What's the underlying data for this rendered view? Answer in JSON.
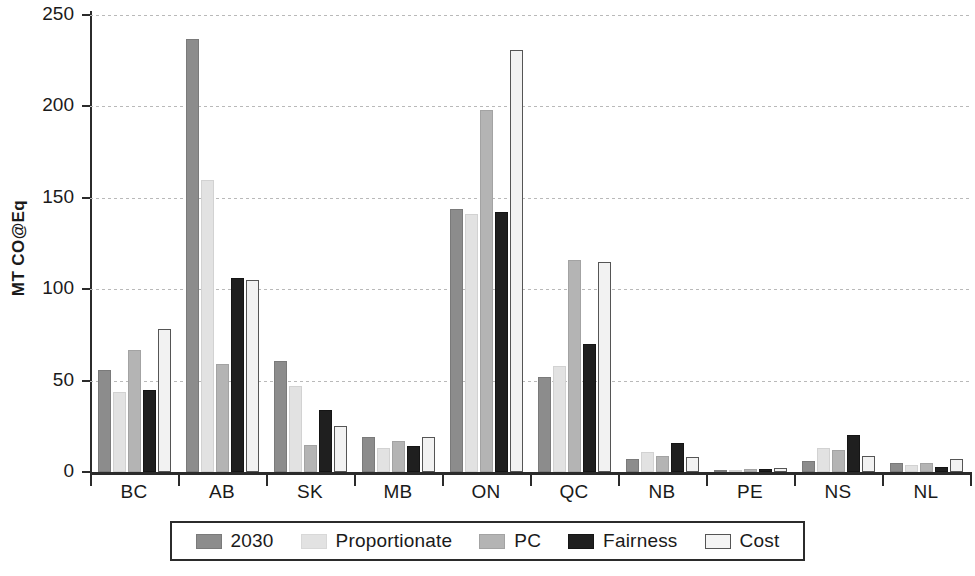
{
  "chart_data": {
    "type": "bar",
    "title": "",
    "xlabel": "",
    "ylabel": "MT CO@Eq",
    "ylim": [
      0,
      250
    ],
    "yticks": [
      0,
      50,
      100,
      150,
      200,
      250
    ],
    "grid": true,
    "legend_position": "bottom",
    "categories": [
      "BC",
      "AB",
      "SK",
      "MB",
      "ON",
      "QC",
      "NB",
      "PE",
      "NS",
      "NL"
    ],
    "series": [
      {
        "name": "2030",
        "values": [
          56,
          237,
          61,
          19,
          144,
          52,
          7,
          0.5,
          6,
          5
        ]
      },
      {
        "name": "Proportionate",
        "values": [
          44,
          160,
          47,
          13,
          141,
          58,
          11,
          1,
          13,
          4
        ]
      },
      {
        "name": "PC",
        "values": [
          67,
          59,
          15,
          17,
          198,
          116,
          9,
          1.5,
          12,
          5
        ]
      },
      {
        "name": "Fairness",
        "values": [
          45,
          106,
          34,
          14,
          142,
          70,
          16,
          1.5,
          20,
          3
        ]
      },
      {
        "name": "Cost",
        "values": [
          78,
          105,
          25,
          19,
          231,
          115,
          8,
          2,
          9,
          7
        ]
      }
    ]
  },
  "colors": {
    "series_2030": "#8c8c8c",
    "series_proportionate": "#e2e2e2",
    "series_pc": "#b4b4b4",
    "series_fairness": "#1f1f1f",
    "series_cost": "#f2f2f2",
    "axis": "#2b2b2b",
    "gridline": "#b9b9b9",
    "background": "#ffffff"
  }
}
